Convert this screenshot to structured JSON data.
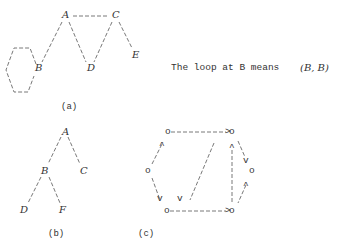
{
  "figure_a": {
    "caption": "(a)",
    "nodes": {
      "A": "A",
      "B": "B",
      "C": "C",
      "D": "D",
      "E": "E"
    },
    "edges": [
      [
        "A",
        "C"
      ],
      [
        "A",
        "B"
      ],
      [
        "A",
        "D"
      ],
      [
        "C",
        "D"
      ],
      [
        "C",
        "E"
      ],
      [
        "B",
        "B"
      ]
    ]
  },
  "note": {
    "text": "The loop at B means",
    "pair": "(B, B)"
  },
  "figure_b": {
    "caption": "(b)",
    "nodes": {
      "A": "A",
      "B": "B",
      "C": "C",
      "D": "D",
      "F": "F"
    },
    "edges": [
      [
        "A",
        "B"
      ],
      [
        "A",
        "C"
      ],
      [
        "B",
        "D"
      ],
      [
        "B",
        "F"
      ]
    ]
  },
  "figure_c": {
    "caption": "(c)",
    "node_glyph": "o",
    "nodes": [
      "o",
      "o",
      "o",
      "o",
      "o",
      "o"
    ]
  }
}
